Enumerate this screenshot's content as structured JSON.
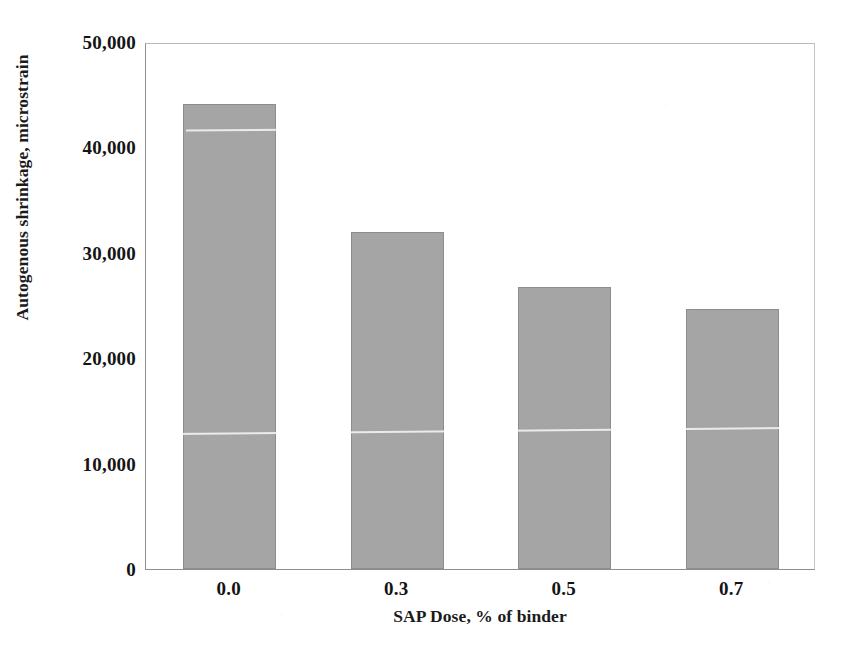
{
  "chart_data": {
    "type": "bar",
    "title": "",
    "categories": [
      "0.0",
      "0.3",
      "0.5",
      "0.7"
    ],
    "values": [
      44100,
      32000,
      26800,
      24700
    ],
    "series": [
      {
        "name": "Autogenous shrinkage",
        "values": [
          44100,
          32000,
          26800,
          24700
        ]
      }
    ],
    "xlabel": "SAP Dose, % of binder",
    "ylabel": "Autogenous shrinkage, microstrain",
    "ylim": [
      0,
      50000
    ],
    "yticks": [
      0,
      10000,
      20000,
      30000,
      40000,
      50000
    ],
    "ytick_labels": [
      "0",
      "10,000",
      "20,000",
      "30,000",
      "40,000",
      "50,000"
    ],
    "grid": false,
    "legend": null,
    "bar_color": "#a9a9a9",
    "bar_edge_color": "#8d8d8d",
    "axis_color": "#8e8e8e",
    "background_color": "#ffffff",
    "text_color": "#141414"
  },
  "axes": {
    "y_title": "Autogenous shrinkage, microstrain",
    "x_title": "SAP Dose, % of binder"
  }
}
